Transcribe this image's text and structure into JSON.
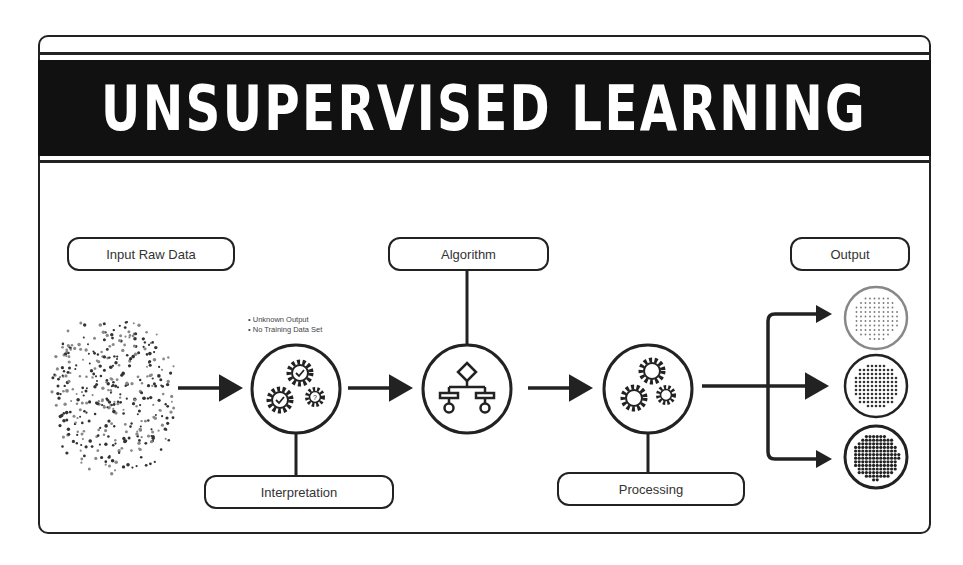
{
  "title": "UNSUPERVISED LEARNING",
  "steps": {
    "input": "Input Raw Data",
    "interpretation": "Interpretation",
    "algorithm": "Algorithm",
    "processing": "Processing",
    "output": "Output"
  },
  "interpretation_notes": [
    "Unknown Output",
    "No Training Data Set"
  ],
  "icons": {
    "raw_data": "scatter-dots-icon",
    "interpretation": "gears-check-question-icon",
    "algorithm": "flowchart-icon",
    "processing": "gears-icon",
    "outputs": [
      "sparse-cluster-icon",
      "medium-cluster-icon",
      "dense-cluster-icon"
    ]
  },
  "colors": {
    "ink": "#222222",
    "banner": "#111111",
    "background": "#ffffff"
  }
}
